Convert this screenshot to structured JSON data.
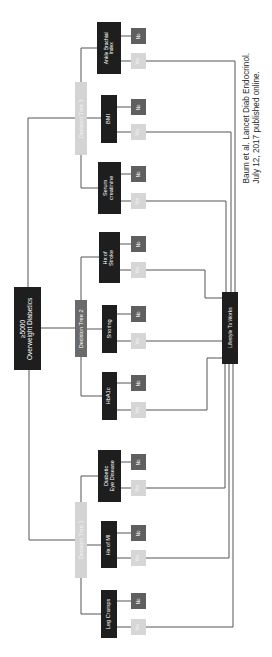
{
  "colors": {
    "dark_node": "#1e1e1e",
    "decision_tree_2": "#6a6a6a",
    "decision_tree_light": "#d4d4d4",
    "no_box": "#5f5f5f",
    "yes_box": "#d6d6d6",
    "connector": "#555555"
  },
  "root": {
    "label": "≥5000\nOverweight Diabetics"
  },
  "outcome": {
    "label": "Lifestyle Tx Works"
  },
  "decision_trees": [
    {
      "label": "Decision Tree 1",
      "factors": [
        {
          "label": "Leg Cramps",
          "no": "No",
          "yes": "Yes"
        },
        {
          "label": "Hx of MI",
          "no": "No",
          "yes": "Yes"
        },
        {
          "label": "Diabetic\nEye Disease",
          "no": "No",
          "yes": "Yes"
        }
      ]
    },
    {
      "label": "Decision Tree 2",
      "factors": [
        {
          "label": "HbA1c",
          "no": "No",
          "yes": "Yes"
        },
        {
          "label": "Snoring",
          "no": "No",
          "yes": "Yes"
        },
        {
          "label": "Hx of\nStroke",
          "no": "No",
          "yes": "Yes"
        }
      ]
    },
    {
      "label": "Decision Tree 3",
      "factors": [
        {
          "label": "Serum\ncreatinine",
          "no": "No",
          "yes": "Yes"
        },
        {
          "label": "BMI",
          "no": "No",
          "yes": "Yes"
        },
        {
          "label": "Ankle Brachial\nIndex",
          "no": "No",
          "yes": "Yes"
        }
      ]
    }
  ],
  "citation": {
    "line1": "Baum et al. Lancet Diab Endocrinol.",
    "line2": "July 12, 2017 published online."
  }
}
